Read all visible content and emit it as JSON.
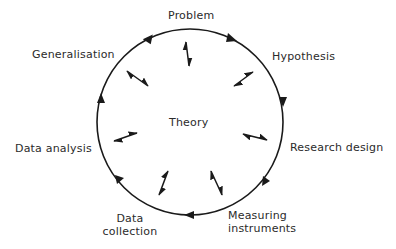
{
  "diagram": {
    "type": "research-cycle",
    "center_label": "Theory",
    "direction": "clockwise",
    "stages": [
      {
        "id": "problem",
        "label": "Problem"
      },
      {
        "id": "hypothesis",
        "label": "Hypothesis"
      },
      {
        "id": "research-design",
        "label": "Research design"
      },
      {
        "id": "measuring-instruments",
        "label_line1": "Measuring",
        "label_line2": "instruments"
      },
      {
        "id": "data-collection",
        "label_line1": "Data",
        "label_line2": "collection"
      },
      {
        "id": "data-analysis",
        "label": "Data analysis"
      },
      {
        "id": "generalisation",
        "label": "Generalisation"
      }
    ],
    "colors": {
      "line": "#1a1a1a",
      "text": "#2b2b2b",
      "background": "#ffffff"
    }
  }
}
